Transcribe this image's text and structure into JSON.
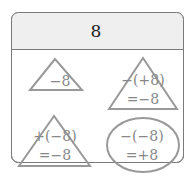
{
  "header": {
    "number": "8"
  },
  "cells": [
    {
      "shape": "triangle",
      "lines": [
        "−8"
      ]
    },
    {
      "shape": "triangle",
      "lines": [
        "−(+8)",
        "=−8"
      ]
    },
    {
      "shape": "triangle",
      "lines": [
        "+(−8)",
        "=−8"
      ]
    },
    {
      "shape": "ellipse",
      "lines": [
        "−(−8)",
        "=+8"
      ]
    }
  ],
  "colors": {
    "border": "#7a7a7a",
    "header_bg": "#efefef",
    "shape_stroke": "#999999",
    "header_text": "#222222",
    "cell_text": "#888888"
  }
}
